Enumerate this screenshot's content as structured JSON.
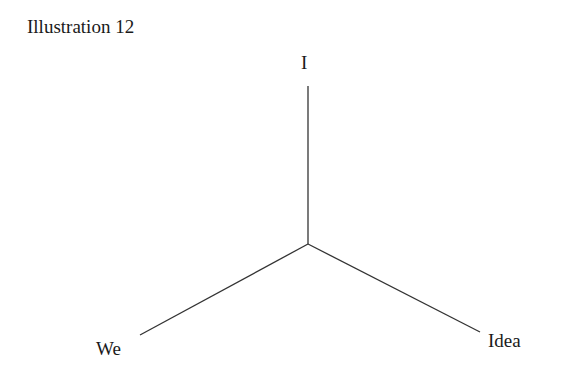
{
  "title": "Illustration 12",
  "diagram": {
    "type": "three-pronged star / tripod",
    "center": {
      "x": 308,
      "y": 244
    },
    "line_color": "#333333",
    "nodes": [
      {
        "id": "top",
        "label": "I",
        "end": {
          "x": 308,
          "y": 86
        }
      },
      {
        "id": "left",
        "label": "We",
        "end": {
          "x": 140,
          "y": 335
        }
      },
      {
        "id": "right",
        "label": "Idea",
        "end": {
          "x": 480,
          "y": 332
        }
      }
    ]
  }
}
